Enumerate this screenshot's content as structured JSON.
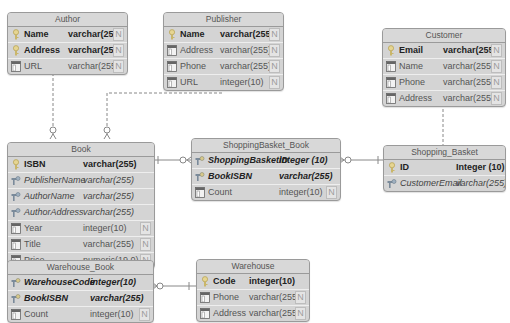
{
  "diagram": {
    "type": "entity-relationship",
    "entities": {
      "author": {
        "name": "Author",
        "fields": [
          {
            "name": "Name",
            "type": "varchar(255)",
            "key": "pk",
            "nullable": "N"
          },
          {
            "name": "Address",
            "type": "varchar(255)",
            "key": "pk",
            "nullable": "N"
          },
          {
            "name": "URL",
            "type": "varchar(255)",
            "key": "col",
            "nullable": "N"
          }
        ]
      },
      "publisher": {
        "name": "Publisher",
        "fields": [
          {
            "name": "Name",
            "type": "varchar(255)",
            "key": "pk",
            "nullable": "N"
          },
          {
            "name": "Address",
            "type": "varchar(255)",
            "key": "col",
            "nullable": "N"
          },
          {
            "name": "Phone",
            "type": "varchar(255)",
            "key": "col",
            "nullable": "N"
          },
          {
            "name": "URL",
            "type": "integer(10)",
            "key": "col",
            "nullable": "N"
          }
        ]
      },
      "customer": {
        "name": "Customer",
        "fields": [
          {
            "name": "Email",
            "type": "varchar(255)",
            "key": "pk",
            "nullable": "N"
          },
          {
            "name": "Name",
            "type": "varchar(255)",
            "key": "col",
            "nullable": "N"
          },
          {
            "name": "Phone",
            "type": "varchar(255)",
            "key": "col",
            "nullable": "N"
          },
          {
            "name": "Address",
            "type": "varchar(255)",
            "key": "col",
            "nullable": "N"
          }
        ]
      },
      "book": {
        "name": "Book",
        "fields": [
          {
            "name": "ISBN",
            "type": "varchar(255)",
            "key": "pk",
            "nullable": ""
          },
          {
            "name": "PublisherName",
            "type": "varchar(255)",
            "key": "fk",
            "nullable": ""
          },
          {
            "name": "AuthorName",
            "type": "varchar(255)",
            "key": "fk",
            "nullable": ""
          },
          {
            "name": "AuthorAddress",
            "type": "varchar(255)",
            "key": "fk",
            "nullable": ""
          },
          {
            "name": "Year",
            "type": "integer(10)",
            "key": "col",
            "nullable": "N"
          },
          {
            "name": "Title",
            "type": "varchar(255)",
            "key": "col",
            "nullable": "N"
          },
          {
            "name": "Price",
            "type": "numeric(19,0)",
            "key": "col",
            "nullable": "N"
          }
        ]
      },
      "shoppingbasket_book": {
        "name": "ShoppingBasket_Book",
        "fields": [
          {
            "name": "ShoppingBasketID",
            "type": "integer (10)",
            "key": "pkfk",
            "nullable": ""
          },
          {
            "name": "BookISBN",
            "type": "varchar(255)",
            "key": "pkfk",
            "nullable": ""
          },
          {
            "name": "Count",
            "type": "integer(10)",
            "key": "col",
            "nullable": "N"
          }
        ]
      },
      "shopping_basket": {
        "name": "Shopping_Basket",
        "fields": [
          {
            "name": "ID",
            "type": "Integer (10)",
            "key": "pk",
            "nullable": ""
          },
          {
            "name": "CustomerEmail",
            "type": "varchar(255)",
            "key": "fk",
            "nullable": ""
          }
        ]
      },
      "warehouse_book": {
        "name": "Warehouse_Book",
        "fields": [
          {
            "name": "WarehouseCode",
            "type": "integer(10)",
            "key": "pkfk",
            "nullable": ""
          },
          {
            "name": "BookISBN",
            "type": "varchar(255)",
            "key": "pkfk",
            "nullable": ""
          },
          {
            "name": "Count",
            "type": "integer(10)",
            "key": "col",
            "nullable": "N"
          }
        ]
      },
      "warehouse": {
        "name": "Warehouse",
        "fields": [
          {
            "name": "Code",
            "type": "integer(10)",
            "key": "pk",
            "nullable": ""
          },
          {
            "name": "Phone",
            "type": "varchar(255)",
            "key": "col",
            "nullable": "N"
          },
          {
            "name": "Address",
            "type": "varchar(255)",
            "key": "col",
            "nullable": "N"
          }
        ]
      }
    },
    "relationships": [
      {
        "from": "Author",
        "to": "Book",
        "style": "dashed",
        "cardinality": "one-to-zero-or-many"
      },
      {
        "from": "Publisher",
        "to": "Book",
        "style": "dashed",
        "cardinality": "one-to-zero-or-many"
      },
      {
        "from": "Customer",
        "to": "Shopping_Basket",
        "style": "dashed",
        "cardinality": "one-to-zero-or-many"
      },
      {
        "from": "Book",
        "to": "ShoppingBasket_Book",
        "style": "solid",
        "cardinality": "one-to-zero-or-many"
      },
      {
        "from": "Shopping_Basket",
        "to": "ShoppingBasket_Book",
        "style": "solid",
        "cardinality": "one-to-zero-or-many"
      },
      {
        "from": "Book",
        "to": "Warehouse_Book",
        "style": "solid",
        "cardinality": "one-to-zero-or-many"
      },
      {
        "from": "Warehouse",
        "to": "Warehouse_Book",
        "style": "solid",
        "cardinality": "one-to-zero-or-many"
      }
    ]
  },
  "colors": {
    "entity_fill": "#d4d4d4",
    "entity_border": "#9a9a9a",
    "line": "#888888",
    "pk_icon": "#c9b66a",
    "fk_icon": "#7a8a9a",
    "col_icon": "#6a6a6a"
  }
}
